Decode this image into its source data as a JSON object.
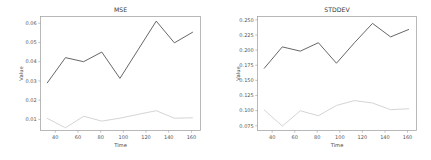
{
  "figure": {
    "background_color": "#ffffff",
    "panels": [
      "mse",
      "stddev"
    ]
  },
  "chart_data": [
    {
      "id": "mse",
      "type": "line",
      "title": "MSE",
      "xlabel": "Time",
      "ylabel": "Value",
      "grid": false,
      "legend": "none",
      "x": [
        33,
        49,
        65,
        81,
        97,
        113,
        129,
        145,
        161
      ],
      "xlim": [
        27,
        168
      ],
      "ylim": [
        0.0042,
        0.0635
      ],
      "xticks": [
        40,
        60,
        80,
        100,
        120,
        140,
        160
      ],
      "xticklabels": [
        "40",
        "60",
        "80",
        "100",
        "120",
        "140",
        "160"
      ],
      "yticks": [
        0.01,
        0.02,
        0.03,
        0.04,
        0.05,
        0.06
      ],
      "yticklabels": [
        "0.01",
        "0.02",
        "0.03",
        "0.04",
        "0.05",
        "0.06"
      ],
      "series": [
        {
          "name": "upper",
          "color": "#555555",
          "values": [
            0.029,
            0.0421,
            0.04,
            0.045,
            0.0313,
            0.0462,
            0.0611,
            0.0498,
            0.0553
          ]
        },
        {
          "name": "lower",
          "color": "#cfcfcf",
          "values": [
            0.0105,
            0.0056,
            0.0116,
            0.0091,
            0.0106,
            0.0126,
            0.0145,
            0.0106,
            0.0108
          ]
        }
      ]
    },
    {
      "id": "stddev",
      "type": "line",
      "title": "STDDEV",
      "xlabel": "Time",
      "ylabel": "Value",
      "grid": false,
      "legend": "none",
      "x": [
        33,
        49,
        65,
        81,
        97,
        113,
        129,
        145,
        161
      ],
      "xlim": [
        27,
        168
      ],
      "ylim": [
        0.0672,
        0.2555
      ],
      "xticks": [
        40,
        60,
        80,
        100,
        120,
        140,
        160
      ],
      "xticklabels": [
        "40",
        "60",
        "80",
        "100",
        "120",
        "140",
        "160"
      ],
      "yticks": [
        0.075,
        0.1,
        0.125,
        0.15,
        0.175,
        0.2,
        0.225,
        0.25
      ],
      "yticklabels": [
        "0.075",
        "0.100",
        "0.125",
        "0.150",
        "0.175",
        "0.200",
        "0.225",
        "0.250"
      ],
      "series": [
        {
          "name": "upper",
          "color": "#555555",
          "values": [
            0.17,
            0.2053,
            0.1983,
            0.2122,
            0.1783,
            0.2122,
            0.2441,
            0.2218,
            0.234
          ]
        },
        {
          "name": "lower",
          "color": "#cfcfcf",
          "values": [
            0.101,
            0.0745,
            0.0998,
            0.0916,
            0.1086,
            0.1166,
            0.1126,
            0.1016,
            0.1031
          ]
        }
      ]
    }
  ]
}
